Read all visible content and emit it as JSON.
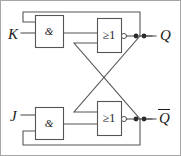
{
  "diagram": {
    "type": "logic-circuit",
    "background_color": "#ffffff",
    "wire_color": "#4a4a4a",
    "text_color": "#1a1a1a"
  },
  "inputs": [
    {
      "id": "K",
      "label": "K",
      "x": 10,
      "y": 27
    },
    {
      "id": "J",
      "label": "J",
      "x": 11,
      "y": 110
    }
  ],
  "outputs": [
    {
      "id": "Q",
      "label": "Q",
      "overline": false,
      "x": 160,
      "y": 26
    },
    {
      "id": "Qbar",
      "label": "Q",
      "overline": true,
      "x": 159,
      "y": 108
    }
  ],
  "gates": [
    {
      "id": "and-top",
      "symbol": "&",
      "kind": "AND",
      "box": {
        "x": 35,
        "y": 15,
        "w": 28,
        "h": 32
      }
    },
    {
      "id": "or-top",
      "symbol": "≥1",
      "kind": "OR",
      "inverted_output": true,
      "box": {
        "x": 97,
        "y": 18,
        "w": 24,
        "h": 34
      }
    },
    {
      "id": "and-bottom",
      "symbol": "&",
      "kind": "AND",
      "box": {
        "x": 35,
        "y": 107,
        "w": 28,
        "h": 32
      }
    },
    {
      "id": "or-bottom",
      "symbol": "≥1",
      "kind": "OR",
      "inverted_output": true,
      "box": {
        "x": 97,
        "y": 101,
        "w": 24,
        "h": 34
      }
    }
  ],
  "junction_dots": [
    {
      "id": "dot-q-1",
      "x": 136,
      "y": 36
    },
    {
      "id": "dot-q-2",
      "x": 144,
      "y": 36
    },
    {
      "id": "dot-qbar-1",
      "x": 136,
      "y": 119
    },
    {
      "id": "dot-qbar-2",
      "x": 144,
      "y": 119
    }
  ],
  "frame": {
    "x": 0.5,
    "y": 0.5,
    "w": 180,
    "h": 155,
    "color": "#9a9a9a"
  }
}
